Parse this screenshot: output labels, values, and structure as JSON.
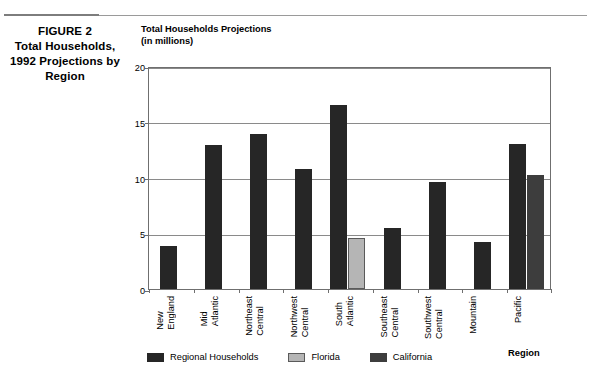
{
  "figure": {
    "caption_lines": [
      "FIGURE 2",
      "Total Households,",
      "1992 Projections by",
      "Region"
    ]
  },
  "chart_data": {
    "type": "bar",
    "title_lines": [
      "Total Households Projections",
      "(in millions)"
    ],
    "title": "Total Households Projections (in millions)",
    "xlabel": "Region",
    "ylabel": "Total Households Projections (in millions)",
    "ylim": [
      0,
      20
    ],
    "yticks": [
      0,
      5,
      10,
      15,
      20
    ],
    "ytick_labels": [
      "0",
      "5",
      "10",
      "15",
      "20"
    ],
    "grid": true,
    "legend_position": "bottom",
    "categories": [
      "New England",
      "Mid Atlantic",
      "Northeast Central",
      "Northwest Central",
      "South Atlantic",
      "Southeast Central",
      "Southwest Central",
      "Mountain",
      "Pacific"
    ],
    "category_label_lines": [
      [
        "New",
        "England"
      ],
      [
        "Mid",
        "Atlantic"
      ],
      [
        "Northeast",
        "Central"
      ],
      [
        "Northwest",
        "Central"
      ],
      [
        "South",
        "Atlantic"
      ],
      [
        "Southeast",
        "Central"
      ],
      [
        "Southwest",
        "Central"
      ],
      [
        "Mountain"
      ],
      [
        "Pacific"
      ]
    ],
    "series": [
      {
        "name": "Regional Households",
        "color": "#262626",
        "values": [
          3.9,
          12.9,
          13.9,
          10.8,
          16.5,
          5.5,
          9.6,
          4.2,
          13.0
        ]
      },
      {
        "name": "Florida",
        "color": "#b5b5b5",
        "values": [
          null,
          null,
          null,
          null,
          4.6,
          null,
          null,
          null,
          null
        ]
      },
      {
        "name": "California",
        "color": "#3d3d3d",
        "values": [
          null,
          null,
          null,
          null,
          null,
          null,
          null,
          null,
          10.2
        ]
      }
    ],
    "legend": [
      {
        "label": "Regional Households",
        "color": "#262626"
      },
      {
        "label": "Florida",
        "color": "#b5b5b5"
      },
      {
        "label": "California",
        "color": "#3d3d3d"
      }
    ]
  }
}
